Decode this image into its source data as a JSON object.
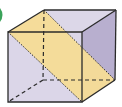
{
  "diagram": {
    "type": "cube-cross-section",
    "colors": {
      "face": "#d9d4e6",
      "right_face": "#b9b0cf",
      "top_face": "#dcd7e8",
      "section": "#f5dc96",
      "edge": "#2b2b2b",
      "marker": "#3aa35a"
    },
    "vertices": {
      "A_front_top_left": [
        8,
        32
      ],
      "B_front_top_right": [
        82,
        32
      ],
      "C_front_bottom_right": [
        82,
        102
      ],
      "D_front_bottom_left": [
        8,
        102
      ],
      "E_back_top_left": [
        44,
        10
      ],
      "F_back_top_right": [
        116,
        10
      ],
      "G_back_bottom_right": [
        115,
        80
      ],
      "H_back_bottom_left": [
        43,
        80
      ]
    },
    "section_plane": [
      "A_front_top_left",
      "E_back_top_left",
      "G_back_bottom_right",
      "C_front_bottom_right"
    ]
  }
}
